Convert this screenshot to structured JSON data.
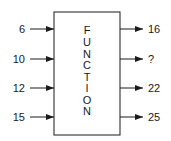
{
  "diagram": {
    "box_label_letters": [
      "F",
      "U",
      "N",
      "C",
      "T",
      "I",
      "O",
      "N"
    ],
    "inputs": [
      "6",
      "10",
      "12",
      "15"
    ],
    "outputs": [
      "16",
      "?",
      "22",
      "25"
    ],
    "stroke_color": "#1a1a1a"
  }
}
